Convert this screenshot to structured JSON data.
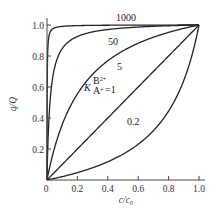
{
  "chart_data": {
    "type": "line",
    "title": "",
    "xlabel": "c/c₀",
    "ylabel": "q/Q",
    "xlim": [
      0,
      1.0
    ],
    "ylim": [
      0,
      1.0
    ],
    "grid": false,
    "legend": "inline curve labels",
    "x_ticks": [
      "0",
      "0.2",
      "0.4",
      "0.6",
      "0.8",
      "1.0"
    ],
    "y_ticks": [
      "0.2",
      "0.4",
      "0.6",
      "0.8",
      "1.0"
    ],
    "model": "q/Q = K*x / (1 + (K-1)*x)",
    "series": [
      {
        "name": "1000",
        "K": 1000,
        "label": "1000",
        "x": [
          0,
          0.01,
          0.05,
          0.1,
          0.2,
          0.4,
          0.6,
          0.8,
          1.0
        ],
        "y": [
          0,
          0.91,
          0.98,
          0.99,
          1.0,
          1.0,
          1.0,
          1.0,
          1.0
        ]
      },
      {
        "name": "50",
        "K": 50,
        "label": "50",
        "x": [
          0,
          0.02,
          0.05,
          0.1,
          0.2,
          0.4,
          0.6,
          0.8,
          1.0
        ],
        "y": [
          0,
          0.51,
          0.72,
          0.85,
          0.93,
          0.97,
          0.99,
          1.0,
          1.0
        ]
      },
      {
        "name": "5",
        "K": 5,
        "label": "5",
        "x": [
          0,
          0.1,
          0.2,
          0.4,
          0.6,
          0.8,
          1.0
        ],
        "y": [
          0,
          0.36,
          0.56,
          0.77,
          0.88,
          0.95,
          1.0
        ]
      },
      {
        "name": "1",
        "K": 1,
        "label": "K^{B2+}_{A+} = 1",
        "x": [
          0,
          0.2,
          0.4,
          0.6,
          0.8,
          1.0
        ],
        "y": [
          0,
          0.2,
          0.4,
          0.6,
          0.8,
          1.0
        ]
      },
      {
        "name": "0.2",
        "K": 0.2,
        "label": "0.2",
        "x": [
          0,
          0.2,
          0.4,
          0.6,
          0.8,
          1.0
        ],
        "y": [
          0,
          0.048,
          0.118,
          0.231,
          0.444,
          1.0
        ]
      }
    ],
    "annotations": {
      "k_symbol": "K",
      "k_sup": "B",
      "k_sup_charge": "2+",
      "k_sub": "A",
      "k_sub_charge": "+",
      "k_value": "=1"
    }
  }
}
